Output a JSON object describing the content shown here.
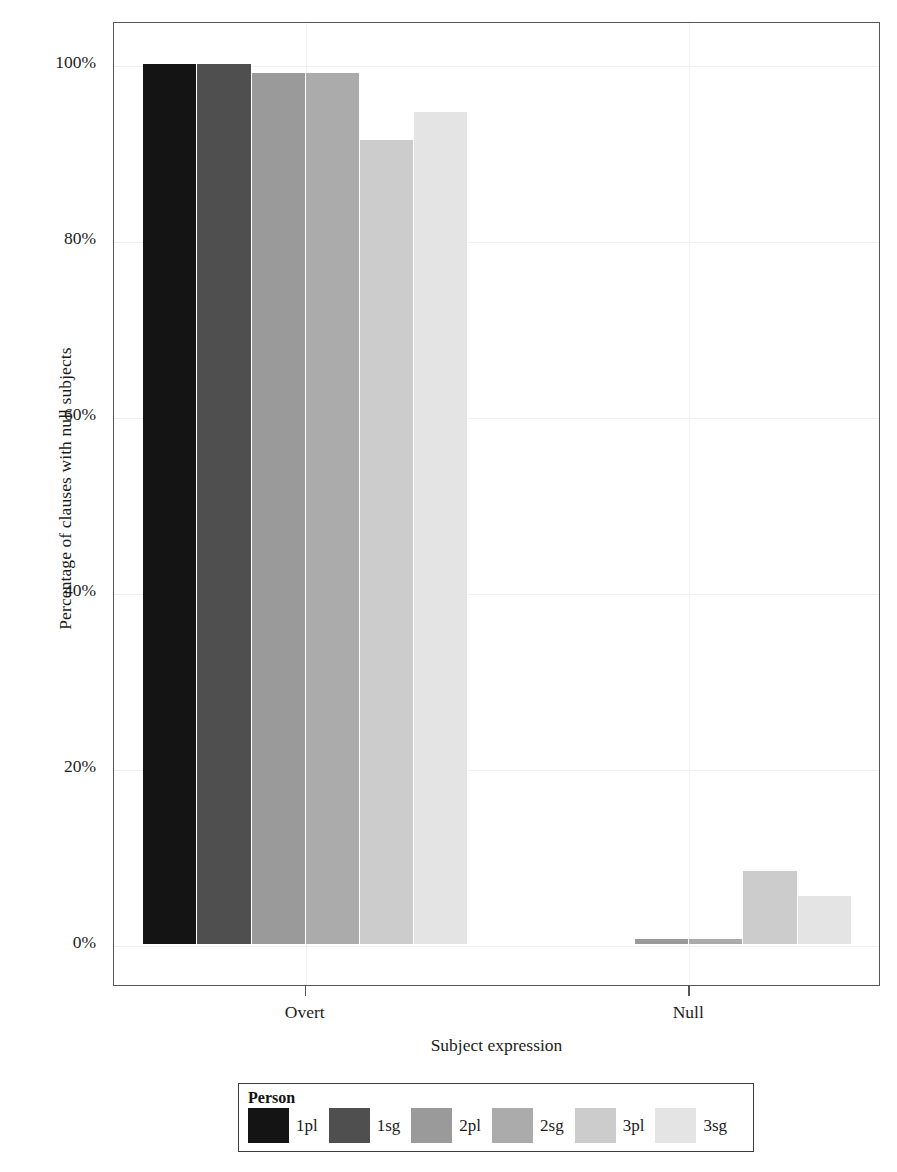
{
  "chart_data": {
    "type": "bar",
    "title": "",
    "xlabel": "Subject expression",
    "ylabel": "Percentage of clauses with null subjects",
    "categories": [
      "Overt",
      "Null"
    ],
    "ylim": [
      0,
      100
    ],
    "yticks": [
      "0%",
      "20%",
      "40%",
      "60%",
      "80%",
      "100%"
    ],
    "ytick_values": [
      0,
      20,
      40,
      60,
      80,
      100
    ],
    "grid": true,
    "legend": {
      "title": "Person",
      "position": "bottom"
    },
    "series": [
      {
        "name": "1pl",
        "color": "#141414",
        "values": [
          100,
          0
        ]
      },
      {
        "name": "1sg",
        "color": "#4f4f4f",
        "values": [
          100,
          0
        ]
      },
      {
        "name": "2pl",
        "color": "#9a9a9a",
        "values": [
          99,
          0.6
        ]
      },
      {
        "name": "2sg",
        "color": "#ababab",
        "values": [
          99,
          0.6
        ]
      },
      {
        "name": "3pl",
        "color": "#cccccc",
        "values": [
          91.4,
          8.3
        ]
      },
      {
        "name": "3sg",
        "color": "#e4e4e4",
        "values": [
          94.6,
          5.5
        ]
      }
    ]
  },
  "axis": {
    "y_title": "Percentage of clauses with null subjects",
    "x_title": "Subject expression"
  }
}
